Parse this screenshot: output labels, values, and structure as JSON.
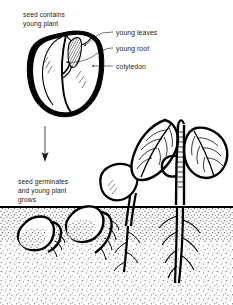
{
  "figure": {
    "title_visible": false,
    "style": "black-and-white line drawing with stippled soil",
    "background_color": "#ffffff",
    "ink_color": "#000000",
    "soil_fill_color": "#6b6b6b",
    "seed_fill_color": "#ffffff"
  },
  "captions": {
    "top": {
      "line1": "seed contains",
      "line2": "young plant"
    },
    "bottom": {
      "line1": "seed germinates",
      "line2": "and young plant",
      "line3": "grows"
    }
  },
  "callouts": [
    {
      "id": "young-leaves",
      "label": "young leaves"
    },
    {
      "id": "young-root",
      "label": "young root"
    },
    {
      "id": "cotyledon",
      "label": "cotyledon"
    }
  ],
  "flow": {
    "arrow_direction": "down",
    "arrow_meaning": "time progresses"
  },
  "stages": [
    {
      "id": "stage-seed-cutaway",
      "name": "cut-away seed showing embryo"
    },
    {
      "id": "stage-seed-buried",
      "name": "buried seed with emerging radicle"
    },
    {
      "id": "stage-root-growing",
      "name": "seed with lengthening root"
    },
    {
      "id": "stage-shoot-up",
      "name": "cotyledon lifted above soil on hooked shoot"
    },
    {
      "id": "stage-seedling",
      "name": "young plant with two leaves and branched root"
    }
  ],
  "ground": {
    "label_visible": false,
    "line_y_fraction": 0.68
  }
}
